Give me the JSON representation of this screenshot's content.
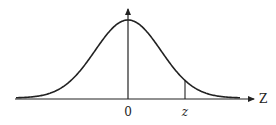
{
  "diagram": {
    "type": "normal-distribution-curve",
    "colors": {
      "stroke": "#222222",
      "background": "#ffffff"
    },
    "axis": {
      "x_label": "Z",
      "origin_label": "0",
      "marker_label": "z"
    }
  },
  "chart_data": {
    "type": "line",
    "title": "",
    "xlabel": "Z",
    "ylabel": "",
    "x_tick_labels": [
      "0",
      "z"
    ],
    "mean": 0,
    "grid": false
  }
}
